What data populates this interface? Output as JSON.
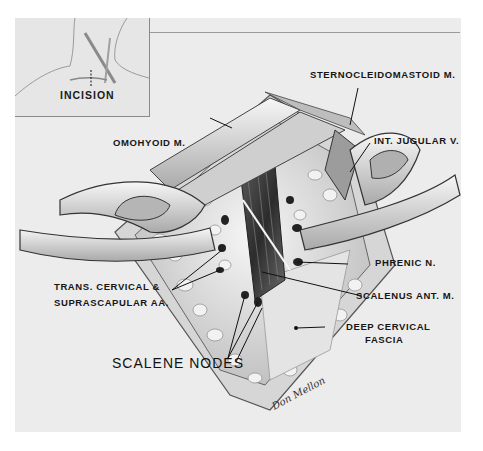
{
  "figure": {
    "inset": {
      "label": "INCISION"
    },
    "labels": {
      "sternocleidomastoid": "STERNOCLEIDOMASTOID M.",
      "int_jugular": "INT. JUGULAR V.",
      "omohyoid": "OMOHYOID M.",
      "trans_cervical_line1": "TRANS. CERVICAL &",
      "trans_cervical_line2": "SUPRASCAPULAR AA.",
      "phrenic": "PHRENIC N.",
      "scalenus": "SCALENUS ANT. M.",
      "deep_cervical_line1": "DEEP CERVICAL",
      "deep_cervical_line2": "FASCIA",
      "scalene_nodes": "SCALENE NODES"
    },
    "signature": "Don Mellon",
    "colors": {
      "background": "#ececec",
      "ink": "#161616",
      "tissue_dark": "#3a3a3a",
      "tissue_light": "#f4f4f4"
    }
  }
}
